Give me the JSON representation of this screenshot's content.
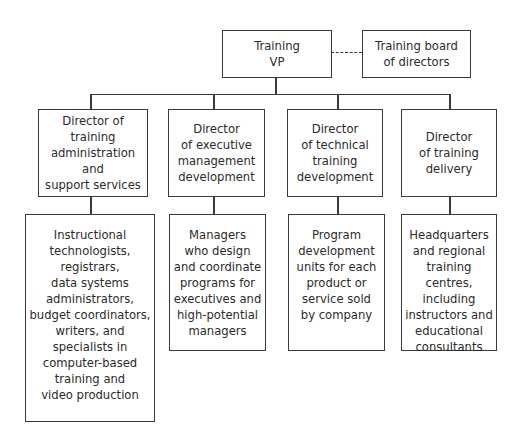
{
  "chart": {
    "root": {
      "label": "Training\nVP"
    },
    "advisory": {
      "label": "Training board\nof directors",
      "relation": "dashed"
    },
    "directors": [
      {
        "label": "Director of\ntraining\nadministration and\nsupport services"
      },
      {
        "label": "Director\nof executive\nmanagement\ndevelopment"
      },
      {
        "label": "Director\nof technical\ntraining\ndevelopment"
      },
      {
        "label": "Director\nof training\ndelivery"
      }
    ],
    "units": [
      {
        "label": "Instructional\ntechnologists,\nregistrars,\ndata systems\nadministrators,\nbudget coordinators,\nwriters, and\nspecialists in\ncomputer-based\ntraining and\nvideo production"
      },
      {
        "label": "Managers\nwho design\nand coordinate\nprograms for\nexecutives and\nhigh-potential\nmanagers"
      },
      {
        "label": "Program\ndevelopment\nunits for each\nproduct or\nservice sold\nby company"
      },
      {
        "label": "Headquarters\nand regional\ntraining centres,\nincluding\ninstructors and\neducational\nconsultants"
      }
    ]
  }
}
